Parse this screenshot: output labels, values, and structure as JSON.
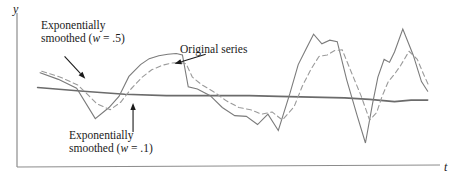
{
  "figure": {
    "background_color": "#ffffff",
    "line_color": "#7b7b7b",
    "axis_color": "#8c8c8c",
    "text_color": "#1a1a1a"
  },
  "axes": {
    "y_label": "y",
    "x_label": "t",
    "show_ticks": false,
    "show_grid": false
  },
  "annotations": {
    "smoothed_w5": {
      "line1": "Exponentially",
      "line2_prefix": "smoothed (",
      "line2_var": "w",
      "line2_suffix": " = .5)"
    },
    "original": {
      "text": "Original series"
    },
    "smoothed_w1": {
      "line1": "Exponentially",
      "line2_prefix": "smoothed (",
      "line2_var": "w",
      "line2_suffix": " = .1)"
    }
  },
  "chart_data": {
    "type": "line",
    "title": "",
    "xlabel": "t",
    "ylabel": "y",
    "grid": false,
    "legend": "annotations-with-arrows",
    "xlim": [
      0,
      100
    ],
    "ylim": [
      0,
      100
    ],
    "note": "Time series plot comparing an original series with two exponentially smoothed versions (w = .5 and w = .1). Values are read in normalized figure units where x runs 0-100 left to right across the plot area and y runs 0-100 bottom to top.",
    "series": [
      {
        "name": "Original series",
        "style": "solid",
        "color": "#7b7b7b",
        "width": 1.1,
        "points": [
          [
            4.6,
            61.0
          ],
          [
            9.0,
            56.5
          ],
          [
            13.4,
            50.5
          ],
          [
            17.9,
            30.0
          ],
          [
            21.2,
            37.5
          ],
          [
            23.6,
            45.0
          ],
          [
            26.0,
            58.5
          ],
          [
            28.8,
            66.5
          ],
          [
            30.9,
            70.5
          ],
          [
            33.2,
            72.5
          ],
          [
            35.4,
            73.5
          ],
          [
            37.4,
            74.0
          ],
          [
            38.9,
            73.0
          ],
          [
            40.3,
            51.5
          ],
          [
            42.5,
            50.0
          ],
          [
            45.6,
            45.5
          ],
          [
            48.5,
            37.5
          ],
          [
            51.5,
            32.0
          ],
          [
            54.3,
            31.5
          ],
          [
            57.0,
            26.0
          ],
          [
            59.5,
            33.0
          ],
          [
            62.0,
            22.0
          ],
          [
            64.8,
            47.0
          ],
          [
            66.8,
            66.5
          ],
          [
            68.6,
            76.5
          ],
          [
            70.5,
            87.0
          ],
          [
            72.5,
            80.5
          ],
          [
            74.4,
            83.0
          ],
          [
            76.2,
            82.0
          ],
          [
            78.5,
            56.0
          ],
          [
            81.0,
            32.0
          ],
          [
            83.0,
            13.5
          ],
          [
            84.7,
            40.0
          ],
          [
            86.0,
            58.0
          ],
          [
            87.5,
            70.0
          ],
          [
            88.8,
            68.0
          ],
          [
            90.0,
            75.0
          ],
          [
            92.0,
            90.5
          ],
          [
            94.5,
            73.0
          ],
          [
            96.5,
            55.0
          ],
          [
            98.0,
            48.5
          ]
        ]
      },
      {
        "name": "Exponentially smoothed (w = .5)",
        "style": "dashed",
        "color": "#9a9a9a",
        "width": 1.1,
        "points": [
          [
            5.0,
            62.0
          ],
          [
            9.5,
            58.0
          ],
          [
            13.8,
            52.5
          ],
          [
            18.3,
            40.0
          ],
          [
            21.5,
            36.0
          ],
          [
            24.0,
            41.0
          ],
          [
            26.5,
            50.0
          ],
          [
            29.2,
            58.0
          ],
          [
            31.5,
            63.0
          ],
          [
            34.0,
            66.0
          ],
          [
            36.2,
            67.5
          ],
          [
            38.2,
            68.0
          ],
          [
            39.8,
            67.0
          ],
          [
            41.3,
            58.0
          ],
          [
            43.5,
            53.0
          ],
          [
            46.5,
            48.0
          ],
          [
            49.5,
            42.0
          ],
          [
            52.5,
            37.5
          ],
          [
            55.3,
            36.0
          ],
          [
            58.0,
            33.0
          ],
          [
            60.5,
            34.5
          ],
          [
            63.0,
            29.0
          ],
          [
            65.8,
            38.0
          ],
          [
            67.8,
            52.0
          ],
          [
            69.8,
            63.0
          ],
          [
            71.8,
            72.0
          ],
          [
            73.8,
            73.0
          ],
          [
            75.6,
            76.0
          ],
          [
            77.4,
            76.5
          ],
          [
            79.5,
            62.0
          ],
          [
            82.0,
            45.0
          ],
          [
            84.0,
            29.0
          ],
          [
            85.7,
            34.0
          ],
          [
            87.0,
            45.0
          ],
          [
            88.5,
            55.0
          ],
          [
            90.0,
            60.0
          ],
          [
            91.5,
            66.0
          ],
          [
            93.5,
            75.5
          ],
          [
            95.5,
            70.0
          ],
          [
            97.0,
            60.0
          ],
          [
            98.3,
            52.0
          ]
        ]
      },
      {
        "name": "Exponentially smoothed (w = .1)",
        "style": "solid",
        "color": "#6b6b6b",
        "width": 1.6,
        "points": [
          [
            4.0,
            51.0
          ],
          [
            15.0,
            48.5
          ],
          [
            25.0,
            46.5
          ],
          [
            35.0,
            45.5
          ],
          [
            45.0,
            45.5
          ],
          [
            55.0,
            45.5
          ],
          [
            62.0,
            45.0
          ],
          [
            70.0,
            44.5
          ],
          [
            78.0,
            44.0
          ],
          [
            84.0,
            43.0
          ],
          [
            90.0,
            41.5
          ],
          [
            94.0,
            42.5
          ],
          [
            98.0,
            42.5
          ]
        ]
      }
    ],
    "arrows": [
      {
        "label": "Exponentially smoothed (w = .5)",
        "from": [
          10.5,
          72.0
        ],
        "to": [
          15.5,
          57.0
        ]
      },
      {
        "label": "Original series",
        "from": [
          44.5,
          73.5
        ],
        "to": [
          37.0,
          67.0
        ]
      },
      {
        "label": "Exponentially smoothed (w = .1)",
        "from": [
          27.0,
          21.0
        ],
        "to": [
          27.0,
          40.5
        ]
      }
    ]
  }
}
